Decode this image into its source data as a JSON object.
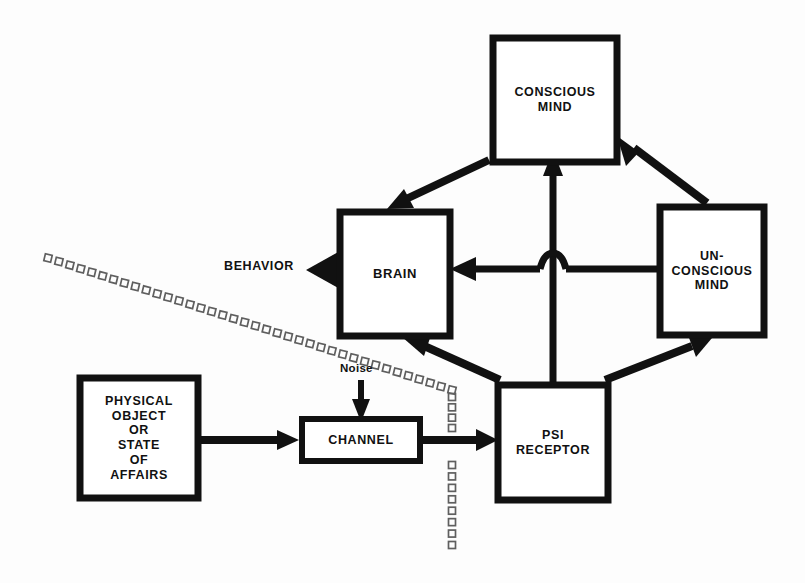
{
  "diagram": {
    "background_color": "#fdfdfd",
    "line_color": "#111111",
    "dotted_color": "#5f5f5f",
    "nodes": {
      "conscious_mind": {
        "label": "CONSCIOUS\nMIND",
        "lines": [
          "CONSCIOUS",
          "MIND"
        ]
      },
      "brain": {
        "label": "BRAIN",
        "lines": [
          "BRAIN"
        ]
      },
      "unconscious_mind": {
        "label": "UN-\nCONSCIOUS\nMIND",
        "lines": [
          "UN-",
          "CONSCIOUS",
          "MIND"
        ]
      },
      "psi_receptor": {
        "label": "PSI\nRECEPTOR",
        "lines": [
          "PSI",
          "RECEPTOR"
        ]
      },
      "physical_object": {
        "label": "PHYSICAL\nOBJECT\nOR\nSTATE\nOF\nAFFAIRS",
        "lines": [
          "PHYSICAL",
          "OBJECT",
          "OR",
          "STATE",
          "OF",
          "AFFAIRS"
        ]
      },
      "channel": {
        "label": "CHANNEL",
        "lines": [
          "CHANNEL"
        ]
      }
    },
    "free_labels": {
      "behavior": "BEHAVIOR",
      "noise": "Noise"
    },
    "edges": [
      {
        "name": "conscious-to-brain",
        "from": "conscious_mind",
        "to": "brain",
        "style": "solid",
        "arrow": "to"
      },
      {
        "name": "unconscious-to-conscious",
        "from": "unconscious_mind",
        "to": "conscious_mind",
        "style": "solid",
        "arrow": "to"
      },
      {
        "name": "psi-to-conscious",
        "from": "psi_receptor",
        "to": "conscious_mind",
        "style": "solid",
        "arrow": "to"
      },
      {
        "name": "unconscious-to-brain",
        "from": "unconscious_mind",
        "to": "brain",
        "style": "solid",
        "arrow": "to"
      },
      {
        "name": "psi-to-brain",
        "from": "psi_receptor",
        "to": "brain",
        "style": "solid",
        "arrow": "to"
      },
      {
        "name": "psi-to-unconscious",
        "from": "psi_receptor",
        "to": "unconscious_mind",
        "style": "solid",
        "arrow": "to"
      },
      {
        "name": "brain-to-behavior",
        "from": "brain",
        "to": "behavior",
        "style": "solid",
        "arrow": "to"
      },
      {
        "name": "physical-to-channel",
        "from": "physical_object",
        "to": "channel",
        "style": "solid",
        "arrow": "to"
      },
      {
        "name": "channel-to-psi",
        "from": "channel",
        "to": "psi_receptor",
        "style": "solid",
        "arrow": "to"
      },
      {
        "name": "noise-to-channel",
        "from": "noise",
        "to": "channel",
        "style": "solid",
        "arrow": "to"
      },
      {
        "name": "boundary-dotted-diagonal",
        "from": "upper-left",
        "to": "mid",
        "style": "dotted-squares",
        "arrow": "none"
      },
      {
        "name": "boundary-dotted-vertical",
        "from": "mid",
        "to": "bottom",
        "style": "dotted-squares",
        "arrow": "none"
      }
    ]
  }
}
